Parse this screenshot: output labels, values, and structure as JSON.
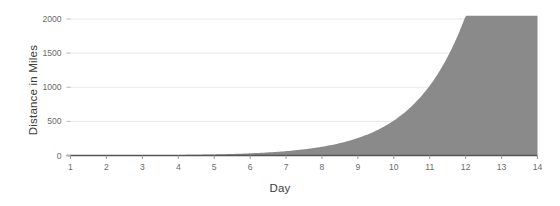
{
  "chart_data": {
    "type": "area",
    "title": "",
    "xlabel": "Day",
    "ylabel": "Distance in Miles",
    "x": [
      1,
      2,
      3,
      4,
      5,
      6,
      7,
      8,
      9,
      10,
      11,
      12,
      13,
      14
    ],
    "values": [
      1,
      2,
      4,
      8,
      16,
      32,
      64,
      128,
      256,
      512,
      1024,
      2048,
      4096,
      8192
    ],
    "series": [
      {
        "name": "Distance in Miles",
        "values": [
          1,
          2,
          4,
          8,
          16,
          32,
          64,
          128,
          256,
          512,
          1024,
          2048,
          4096,
          8192
        ]
      }
    ],
    "categories": [
      "1",
      "2",
      "3",
      "4",
      "5",
      "6",
      "7",
      "8",
      "9",
      "10",
      "11",
      "12",
      "13",
      "14"
    ],
    "xtick_labels": [
      "1",
      "2",
      "3",
      "4",
      "5",
      "6",
      "7",
      "8",
      "9",
      "10",
      "11",
      "12",
      "13",
      "14"
    ],
    "ytick_labels": [
      "0",
      "500",
      "1000",
      "1500",
      "2000"
    ],
    "ytick_values": [
      0,
      500,
      1000,
      1500,
      2000
    ],
    "ylim": [
      0,
      2100
    ],
    "xlim": [
      1,
      14
    ],
    "grid": "horizontal",
    "legend": "none",
    "area_fill_color": "#8a8a8a",
    "gridline_color": "#e8e8e8",
    "axis_color": "#555555",
    "tick_text_color": "#6b6b6b",
    "axis_title_color": "#3d3d3d",
    "background_color": "#ffffff"
  }
}
